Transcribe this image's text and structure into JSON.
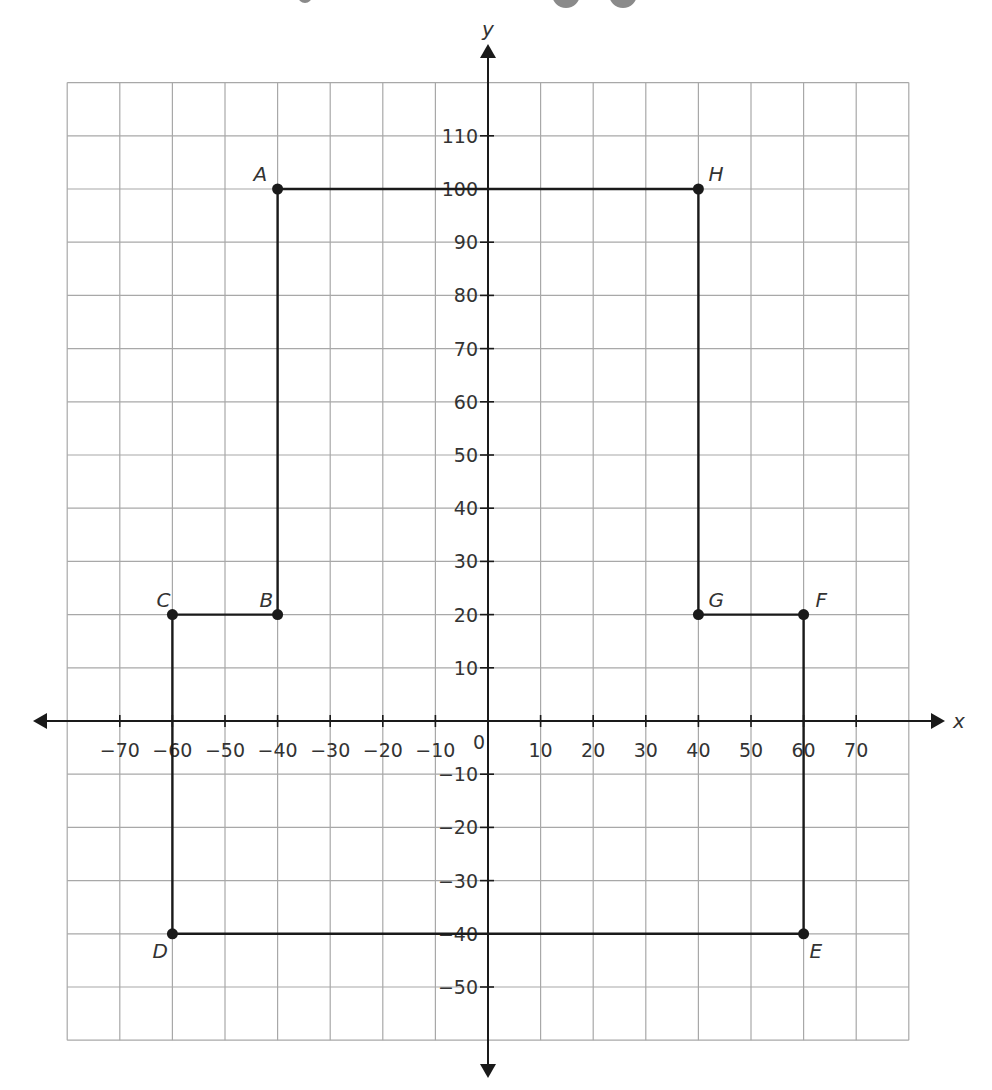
{
  "chart_data": {
    "type": "scatter",
    "title": "",
    "xlabel": "x",
    "ylabel": "y",
    "xlim": [
      -80,
      80
    ],
    "ylim": [
      -60,
      120
    ],
    "grid": true,
    "grid_step": 10,
    "x_ticks": [
      -70,
      -60,
      -50,
      -40,
      -30,
      -20,
      -10,
      10,
      20,
      30,
      40,
      50,
      60,
      70
    ],
    "y_ticks": [
      -50,
      -40,
      -30,
      -20,
      -10,
      10,
      20,
      30,
      40,
      50,
      60,
      70,
      80,
      90,
      100,
      110
    ],
    "origin_label": "0",
    "points": [
      {
        "label": "A",
        "x": -40,
        "y": 100
      },
      {
        "label": "B",
        "x": -40,
        "y": 20
      },
      {
        "label": "C",
        "x": -60,
        "y": 20
      },
      {
        "label": "D",
        "x": -60,
        "y": -40
      },
      {
        "label": "E",
        "x": 60,
        "y": -40
      },
      {
        "label": "F",
        "x": 60,
        "y": 20
      },
      {
        "label": "G",
        "x": 40,
        "y": 20
      },
      {
        "label": "H",
        "x": 40,
        "y": 100
      }
    ],
    "polygon_order": [
      "A",
      "B",
      "C",
      "D",
      "E",
      "F",
      "G",
      "H"
    ],
    "closed": true
  },
  "layout": {
    "origin_px": [
      488,
      721
    ],
    "x_scale": 5.26,
    "y_scale": 5.32,
    "line_color": "#1a1a1a",
    "grid_color": "#a8a8a8"
  }
}
